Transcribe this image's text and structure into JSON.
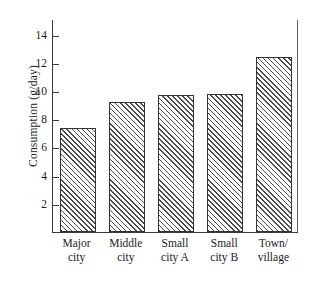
{
  "chart_data": {
    "type": "bar",
    "title": "",
    "subtitle": "",
    "xlabel": "",
    "ylabel": "Consumption (g/day)",
    "categories": [
      "Major\ncity",
      "Middle\ncity",
      "Small\ncity A",
      "Small\ncity B",
      "Town/\nvillage"
    ],
    "categories_flat": [
      "Major city",
      "Middle city",
      "Small city A",
      "Small city B",
      "Town/village"
    ],
    "values": [
      7.4,
      9.2,
      9.7,
      9.75,
      12.4
    ],
    "ylim": [
      0,
      15.1
    ],
    "yticks": [
      2,
      4,
      6,
      8,
      10,
      12,
      14
    ],
    "ytick_labels": [
      "2",
      "4",
      "6",
      "8",
      "10",
      "12",
      "14"
    ],
    "grid": false,
    "legend": null,
    "annotations": [],
    "bar_style": {
      "fill": "diagonal-hatch",
      "hatch_color": "#4a4a4a",
      "edge_color": "#333333",
      "background": "#ffffff"
    }
  },
  "axes": {
    "y_title": "Consumption (g/day)",
    "ticks": [
      {
        "value": 14,
        "label": "14"
      },
      {
        "value": 12,
        "label": "12"
      },
      {
        "value": 10,
        "label": "10"
      },
      {
        "value": 8,
        "label": "8"
      },
      {
        "value": 6,
        "label": "6"
      },
      {
        "value": 4,
        "label": "4"
      },
      {
        "value": 2,
        "label": "2"
      }
    ]
  },
  "bars": [
    {
      "label": "Major\ncity",
      "value": 7.4
    },
    {
      "label": "Middle\ncity",
      "value": 9.2
    },
    {
      "label": "Small\ncity A",
      "value": 9.7
    },
    {
      "label": "Small\ncity B",
      "value": 9.75
    },
    {
      "label": "Town/\nvillage",
      "value": 12.4
    }
  ]
}
